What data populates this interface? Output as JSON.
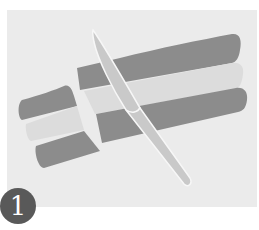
{
  "illustration": {
    "description": "Three stacked clay strips (dark, light, dark) being sliced by a knife",
    "colors": {
      "background": "#ebebeb",
      "dark_strip": "#8c8c8c",
      "light_strip": "#dcdcdc",
      "knife": "#c9c9c9",
      "knife_outline": "#f7f7f7",
      "badge": "#595959"
    }
  },
  "step": {
    "number": "1"
  }
}
